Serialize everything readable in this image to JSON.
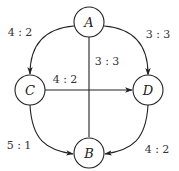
{
  "diagram": {
    "type": "directed-graph",
    "colors": {
      "stroke": "#222222",
      "background": "#ffffff",
      "text": "#333333"
    },
    "nodes": [
      {
        "id": "A",
        "label": "A",
        "x": 89,
        "y": 22
      },
      {
        "id": "B",
        "label": "B",
        "x": 89,
        "y": 153
      },
      {
        "id": "C",
        "label": "C",
        "x": 30,
        "y": 90
      },
      {
        "id": "D",
        "label": "D",
        "x": 148,
        "y": 90
      }
    ],
    "edges": [
      {
        "from": "A",
        "to": "C",
        "label": "4 : 2"
      },
      {
        "from": "A",
        "to": "D",
        "label": "3 : 3"
      },
      {
        "from": "A",
        "to": "B",
        "label": "3 : 3"
      },
      {
        "from": "C",
        "to": "D",
        "label": "4 : 2"
      },
      {
        "from": "C",
        "to": "B",
        "label": "5 : 1"
      },
      {
        "from": "D",
        "to": "B",
        "label": "4 : 2"
      }
    ]
  }
}
